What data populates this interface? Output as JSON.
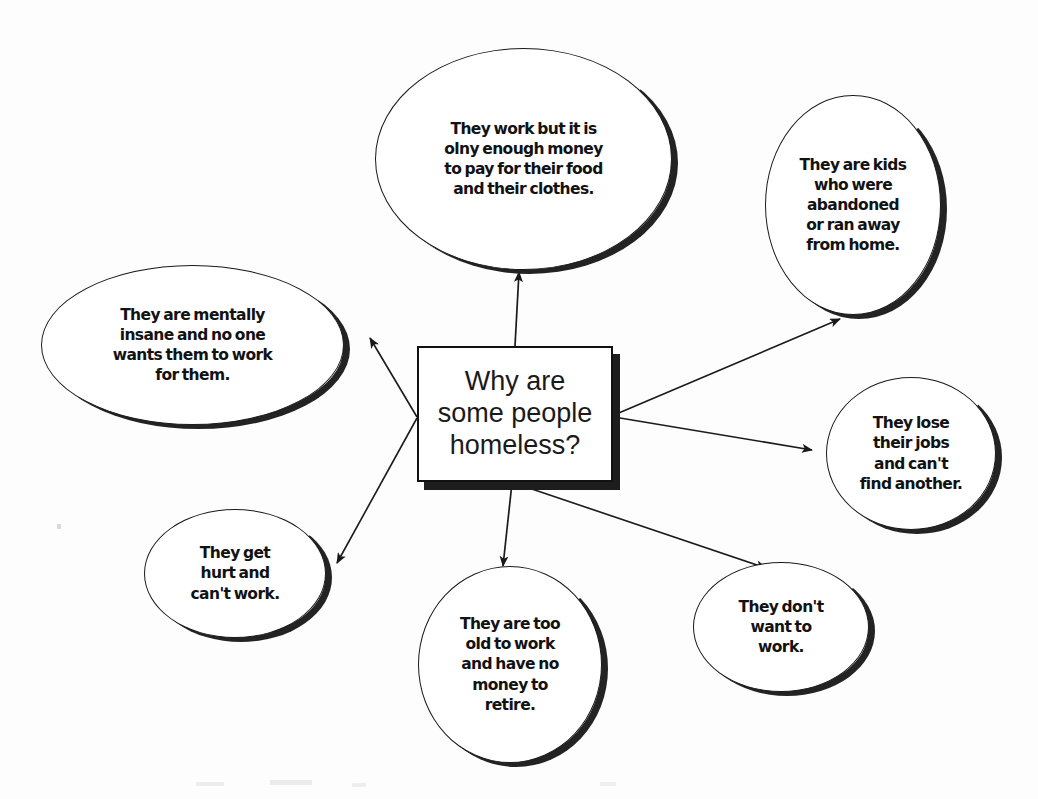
{
  "diagram": {
    "title": "Why are some people homeless?",
    "type": "mind-map",
    "background_color": "#fdfdfd",
    "ink_color": "#121212"
  },
  "center": {
    "label": "Why are\nsome people\nhomeless?",
    "shape": "rectangle-with-drop-shadow"
  },
  "branches": [
    {
      "id": "work-low-pay",
      "label": "They work but it is\nolny enough money\nto pay for their food\nand their clothes.",
      "position": "top",
      "shape": "ellipse"
    },
    {
      "id": "abandoned-kids",
      "label": "They are kids\nwho were\nabandoned\nor ran away\nfrom home.",
      "position": "top-right",
      "shape": "ellipse"
    },
    {
      "id": "mentally-insane",
      "label": "They are mentally\ninsane and no one\nwants them to work\nfor them.",
      "position": "left",
      "shape": "ellipse"
    },
    {
      "id": "lose-jobs",
      "label": "They lose\ntheir jobs\nand can't\nfind another.",
      "position": "right",
      "shape": "ellipse"
    },
    {
      "id": "get-hurt",
      "label": "They get\nhurt and\ncan't work.",
      "position": "bottom-left",
      "shape": "ellipse"
    },
    {
      "id": "too-old",
      "label": "They are too\nold to work\nand have no\nmoney to\nretire.",
      "position": "bottom",
      "shape": "ellipse"
    },
    {
      "id": "dont-want-work",
      "label": "They don't\nwant to\nwork.",
      "position": "bottom-right",
      "shape": "ellipse"
    }
  ],
  "connections": [
    {
      "from": "center",
      "to": "work-low-pay",
      "style": "arrow"
    },
    {
      "from": "center",
      "to": "abandoned-kids",
      "style": "arrow"
    },
    {
      "from": "center",
      "to": "mentally-insane",
      "style": "arrow"
    },
    {
      "from": "center",
      "to": "lose-jobs",
      "style": "arrow"
    },
    {
      "from": "center",
      "to": "get-hurt",
      "style": "arrow"
    },
    {
      "from": "center",
      "to": "too-old",
      "style": "arrow"
    },
    {
      "from": "center",
      "to": "dont-want-work",
      "style": "arrow"
    }
  ]
}
